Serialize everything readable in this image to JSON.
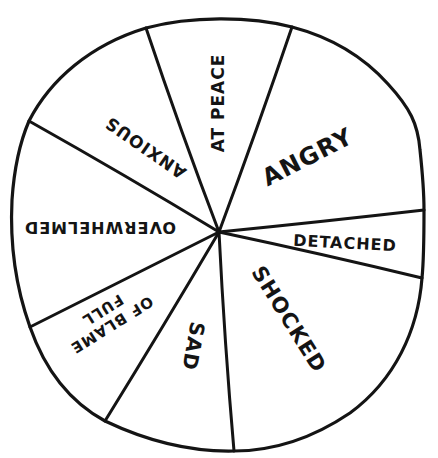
{
  "chart_data": {
    "type": "pie",
    "title": "",
    "style": "hand-drawn black-and-white emotion wheel, no values shown",
    "center": [
      219,
      232
    ],
    "legend": "none (labels drawn inside slices)",
    "categories": [
      "At Peace",
      "Angry",
      "Detached",
      "Shocked",
      "Sad",
      "Full of Blame",
      "Overwhelmed",
      "Anxious"
    ],
    "values_degrees": [
      39.3,
      64.3,
      18.9,
      73.3,
      35.0,
      32.2,
      57.0,
      40.0
    ],
    "values_percent": [
      10.9,
      17.9,
      5.3,
      20.4,
      9.7,
      8.9,
      15.8,
      11.1
    ],
    "slices": [
      {
        "label": "AT PEACE",
        "lines": [
          "AT PEACE"
        ],
        "start_deg": 340.3,
        "end_deg": 19.6,
        "text_x": 219,
        "text_y": 103,
        "rotate": -90,
        "size": 17
      },
      {
        "label": "ANGRY",
        "lines": [
          "ANGRY"
        ],
        "start_deg": 19.6,
        "end_deg": 83.9,
        "text_x": 308,
        "text_y": 158,
        "rotate": -27,
        "size": 24
      },
      {
        "label": "DETACHED",
        "lines": [
          "DETACHED"
        ],
        "start_deg": 83.9,
        "end_deg": 102.8,
        "text_x": 345,
        "text_y": 244,
        "rotate": 3,
        "size": 16
      },
      {
        "label": "SHOCKED",
        "lines": [
          "SHOCKED"
        ],
        "start_deg": 102.8,
        "end_deg": 176.1,
        "text_x": 288,
        "text_y": 320,
        "rotate": 58,
        "size": 21
      },
      {
        "label": "SAD",
        "lines": [
          "SAD"
        ],
        "start_deg": 176.1,
        "end_deg": 211.1,
        "text_x": 192,
        "text_y": 346,
        "rotate": 100,
        "size": 20
      },
      {
        "label": "FULL OF BLAME",
        "lines": [
          "OF BLAME",
          "FULL"
        ],
        "start_deg": 211.1,
        "end_deg": 243.3,
        "text_x": 107,
        "text_y": 317,
        "rotate": 148,
        "size": 15
      },
      {
        "label": "OVERWHELMED",
        "lines": [
          "OVERWHELMED"
        ],
        "start_deg": 243.3,
        "end_deg": 300.3,
        "text_x": 100,
        "text_y": 226,
        "rotate": 180,
        "size": 16
      },
      {
        "label": "ANXIOUS",
        "lines": [
          "ANXIOUS"
        ],
        "start_deg": 300.3,
        "end_deg": 340.3,
        "text_x": 146,
        "text_y": 147,
        "rotate": 215,
        "size": 17
      }
    ],
    "spokes": [
      {
        "x": 146,
        "y": 28
      },
      {
        "x": 292,
        "y": 27
      },
      {
        "x": 424,
        "y": 210
      },
      {
        "x": 422,
        "y": 278
      },
      {
        "x": 234,
        "y": 451
      },
      {
        "x": 105,
        "y": 421
      },
      {
        "x": 30,
        "y": 327
      },
      {
        "x": 29,
        "y": 121
      }
    ],
    "colors": {
      "ink": "#141414",
      "fill": "#ffffff"
    }
  }
}
